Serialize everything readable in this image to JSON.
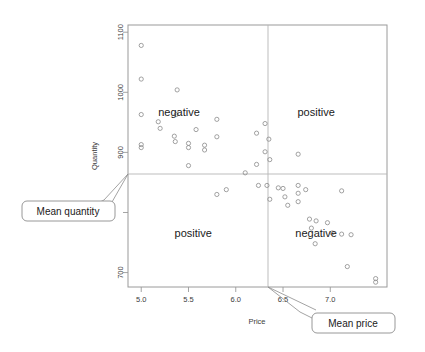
{
  "chart_data": {
    "type": "scatter",
    "title": "",
    "xlabel": "Price",
    "ylabel": "Quantity",
    "xlim": [
      4.86,
      7.6
    ],
    "ylim": [
      676,
      1112
    ],
    "xticks": [
      5.0,
      5.5,
      6.0,
      6.5,
      7.0
    ],
    "xtick_labels": [
      "5.0",
      "5.5",
      "6.0",
      "6.5",
      "7.0"
    ],
    "yticks": [
      700,
      800,
      900,
      1000,
      1100
    ],
    "ytick_labels": [
      "700",
      "",
      "900",
      "1000",
      "1100"
    ],
    "grid": false,
    "legend": "none",
    "mean_price": 6.24,
    "mean_quantity": 845,
    "annotations": [
      {
        "name": "mean-quantity-callout",
        "text": "Mean quantity"
      },
      {
        "name": "mean-price-callout",
        "text": "Mean price"
      }
    ],
    "quadrant_labels": [
      {
        "name": "top-left",
        "text": "negative",
        "x": 5.4,
        "y": 960
      },
      {
        "name": "top-right",
        "text": "positive",
        "x": 6.85,
        "y": 960
      },
      {
        "name": "bottom-left",
        "text": "positive",
        "x": 5.55,
        "y": 760
      },
      {
        "name": "bottom-right",
        "text": "negative",
        "x": 6.85,
        "y": 760
      }
    ],
    "points": [
      {
        "x": 5.0,
        "y": 1078
      },
      {
        "x": 5.0,
        "y": 1022
      },
      {
        "x": 5.0,
        "y": 963
      },
      {
        "x": 5.0,
        "y": 913
      },
      {
        "x": 5.0,
        "y": 908
      },
      {
        "x": 5.18,
        "y": 951
      },
      {
        "x": 5.2,
        "y": 940
      },
      {
        "x": 5.38,
        "y": 1004
      },
      {
        "x": 5.37,
        "y": 963
      },
      {
        "x": 5.35,
        "y": 927
      },
      {
        "x": 5.36,
        "y": 918
      },
      {
        "x": 5.5,
        "y": 878
      },
      {
        "x": 5.5,
        "y": 915
      },
      {
        "x": 5.5,
        "y": 908
      },
      {
        "x": 5.58,
        "y": 938
      },
      {
        "x": 5.67,
        "y": 912
      },
      {
        "x": 5.67,
        "y": 904
      },
      {
        "x": 5.8,
        "y": 955
      },
      {
        "x": 5.8,
        "y": 926
      },
      {
        "x": 5.8,
        "y": 830
      },
      {
        "x": 5.9,
        "y": 838
      },
      {
        "x": 6.1,
        "y": 866
      },
      {
        "x": 6.22,
        "y": 932
      },
      {
        "x": 6.22,
        "y": 880
      },
      {
        "x": 6.24,
        "y": 845
      },
      {
        "x": 6.31,
        "y": 948
      },
      {
        "x": 6.31,
        "y": 901
      },
      {
        "x": 6.33,
        "y": 845
      },
      {
        "x": 6.35,
        "y": 922
      },
      {
        "x": 6.36,
        "y": 888
      },
      {
        "x": 6.36,
        "y": 822
      },
      {
        "x": 6.45,
        "y": 841
      },
      {
        "x": 6.5,
        "y": 840
      },
      {
        "x": 6.52,
        "y": 826
      },
      {
        "x": 6.55,
        "y": 812
      },
      {
        "x": 6.66,
        "y": 897
      },
      {
        "x": 6.66,
        "y": 845
      },
      {
        "x": 6.66,
        "y": 832
      },
      {
        "x": 6.66,
        "y": 818
      },
      {
        "x": 6.74,
        "y": 838
      },
      {
        "x": 6.78,
        "y": 789
      },
      {
        "x": 6.8,
        "y": 774
      },
      {
        "x": 6.85,
        "y": 786
      },
      {
        "x": 6.84,
        "y": 748
      },
      {
        "x": 6.97,
        "y": 783
      },
      {
        "x": 7.02,
        "y": 766
      },
      {
        "x": 7.12,
        "y": 836
      },
      {
        "x": 7.12,
        "y": 764
      },
      {
        "x": 7.18,
        "y": 710
      },
      {
        "x": 7.22,
        "y": 763
      },
      {
        "x": 7.48,
        "y": 690
      },
      {
        "x": 7.48,
        "y": 684
      }
    ]
  },
  "figure": {
    "axis_titles": {
      "x": "Price",
      "y": "Quantity"
    },
    "callouts": {
      "mean_quantity": "Mean quantity",
      "mean_price": "Mean price"
    }
  }
}
